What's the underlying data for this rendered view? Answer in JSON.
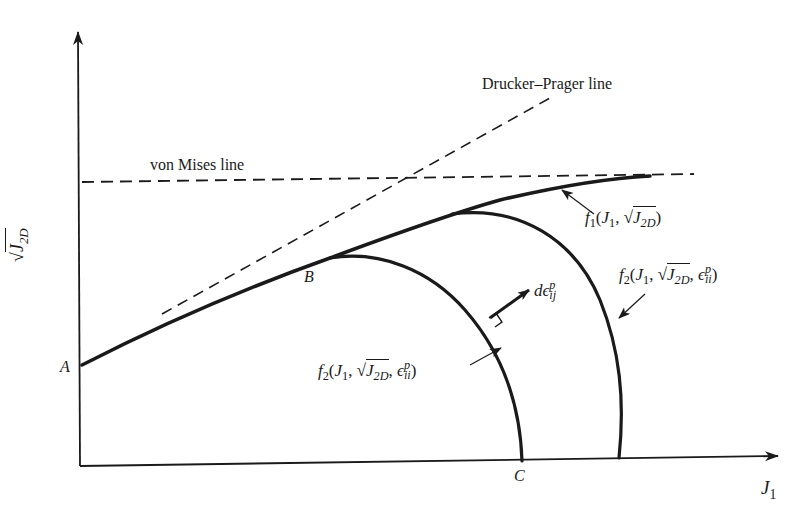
{
  "figure": {
    "type": "yield-surface-diagram",
    "axes": {
      "x_label": {
        "main": "J",
        "sub": "1"
      },
      "y_label": {
        "root": "√",
        "main": "J",
        "sub": "2D"
      }
    },
    "lines": {
      "von_mises": "von Mises line",
      "drucker_prager": "Drucker–Prager line"
    },
    "points": {
      "A": "A",
      "B": "B",
      "C": "C"
    },
    "curves": {
      "f1": {
        "fn": "f",
        "fn_sub": "1",
        "open": "(",
        "j1": "J",
        "j1_sub": "1",
        "comma": ",",
        "root": "√",
        "j2": "J",
        "j2_sub": "2D",
        "close": ")"
      },
      "f2_inner": {
        "fn": "f",
        "fn_sub": "2",
        "open": "(",
        "j1": "J",
        "j1_sub": "1",
        "comma": ",",
        "root": "√",
        "j2": "J",
        "j2_sub": "2D",
        "comma2": ",",
        "eps": "ϵ",
        "eps_sup": "p",
        "eps_sub": "ii",
        "close": ")"
      },
      "f2_outer": {
        "fn": "f",
        "fn_sub": "2",
        "open": "(",
        "j1": "J",
        "j1_sub": "1",
        "comma": ",",
        "root": "√",
        "j2": "J",
        "j2_sub": "2D",
        "comma2": ",",
        "eps": "ϵ",
        "eps_sup": "p",
        "eps_sub": "ii",
        "close": ")"
      }
    },
    "normal_vector": {
      "d": "d",
      "eps": "ϵ",
      "sup": "p",
      "sub": "ij"
    },
    "colors": {
      "ink": "#1a1a1a",
      "background": "#ffffff"
    }
  }
}
